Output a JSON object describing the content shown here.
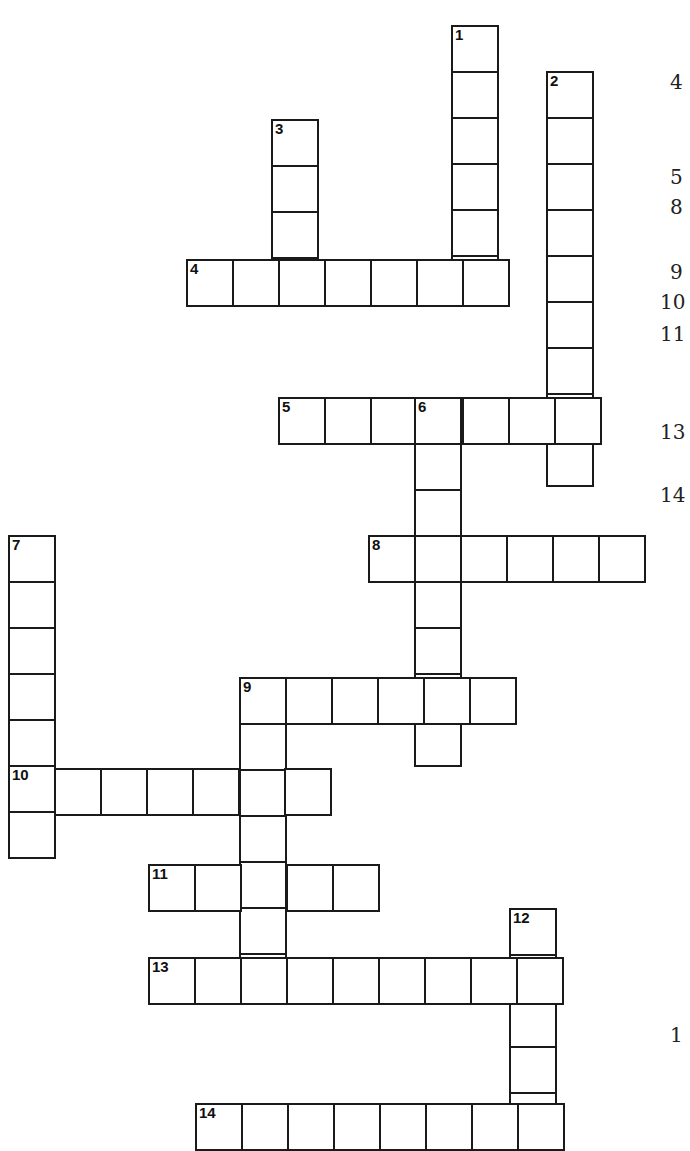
{
  "puzzle": {
    "cell_size": 46,
    "colors": {
      "border": "#1a1a1a",
      "background": "#ffffff",
      "text": "#111111"
    },
    "words": [
      {
        "number": "1",
        "direction": "down",
        "x": 451,
        "y": 25,
        "length": 6
      },
      {
        "number": "2",
        "direction": "down",
        "x": 546,
        "y": 71,
        "length": 9
      },
      {
        "number": "3",
        "direction": "down",
        "x": 271,
        "y": 119,
        "length": 4
      },
      {
        "number": "4",
        "direction": "across",
        "x": 186,
        "y": 259,
        "length": 7
      },
      {
        "number": "5",
        "direction": "across",
        "x": 278,
        "y": 397,
        "length": 7
      },
      {
        "number": "6",
        "direction": "down",
        "x": 414,
        "y": 397,
        "length": 8
      },
      {
        "number": "7",
        "direction": "down",
        "x": 8,
        "y": 535,
        "length": 7
      },
      {
        "number": "8",
        "direction": "across",
        "x": 368,
        "y": 535,
        "length": 6
      },
      {
        "number": "9",
        "direction": "across",
        "x": 239,
        "y": 677,
        "length": 6
      },
      {
        "number": "9",
        "direction": "down",
        "x": 239,
        "y": 677,
        "length": 7
      },
      {
        "number": "10",
        "direction": "across",
        "x": 8,
        "y": 768,
        "length": 7
      },
      {
        "number": "11",
        "direction": "across",
        "x": 148,
        "y": 864,
        "length": 5
      },
      {
        "number": "12",
        "direction": "down",
        "x": 509,
        "y": 908,
        "length": 5
      },
      {
        "number": "13",
        "direction": "across",
        "x": 148,
        "y": 957,
        "length": 9
      },
      {
        "number": "14",
        "direction": "across",
        "x": 195,
        "y": 1103,
        "length": 8
      }
    ]
  },
  "clues_panel": {
    "visible_numbers": [
      {
        "label": "4",
        "y": 70
      },
      {
        "label": "5",
        "y": 165
      },
      {
        "label": "8",
        "y": 195
      },
      {
        "label": "9",
        "y": 260
      },
      {
        "label": "10",
        "y": 290
      },
      {
        "label": "11",
        "y": 322
      },
      {
        "label": "13",
        "y": 420
      },
      {
        "label": "14",
        "y": 483
      },
      {
        "label": "1",
        "y": 1023
      }
    ]
  }
}
